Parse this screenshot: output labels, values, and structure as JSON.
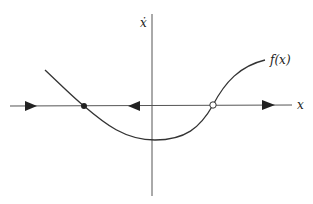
{
  "diagram": {
    "type": "phase-line",
    "vertical_axis_label": "ẋ",
    "horizontal_axis_label": "x",
    "curve_label": "f(x)",
    "fixed_points": [
      {
        "kind": "stable",
        "marker": "filled-circle"
      },
      {
        "kind": "unstable",
        "marker": "open-circle"
      }
    ],
    "flow_arrows": [
      "right",
      "left",
      "right"
    ],
    "colors": {
      "line": "#333333",
      "axis": "#555555",
      "background": "#ffffff"
    }
  }
}
